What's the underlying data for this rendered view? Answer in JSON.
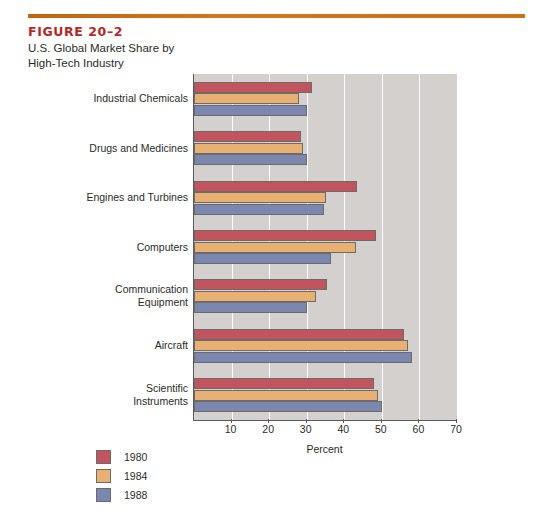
{
  "header": {
    "figure_number": "FIGURE 20–2",
    "caption_line_1": "U.S. Global Market Share by",
    "caption_line_2": "High-Tech Industry",
    "rule_color": "#cf6f16",
    "figure_number_color": "#b02a2a"
  },
  "chart_data": {
    "type": "bar",
    "orientation": "horizontal",
    "title": "U.S. Global Market Share by High-Tech Industry",
    "xlabel": "Percent",
    "ylabel": "",
    "xlim": [
      0,
      70
    ],
    "xticks": [
      10,
      20,
      30,
      40,
      50,
      60,
      70
    ],
    "grid": true,
    "grid_axis": "x",
    "legend_position": "below-left",
    "plot_background": "#d3d0cd",
    "categories": [
      "Industrial Chemicals",
      "Drugs and Medicines",
      "Engines and Turbines",
      "Computers",
      "Communication Equipment",
      "Aircraft",
      "Scientific Instruments"
    ],
    "series": [
      {
        "name": "1980",
        "color": "#c1545c",
        "values": [
          31.5,
          28.5,
          43.5,
          48.5,
          35.5,
          56.0,
          48.0
        ]
      },
      {
        "name": "1984",
        "color": "#e8b173",
        "values": [
          28.0,
          29.0,
          35.0,
          43.0,
          32.5,
          57.0,
          49.0
        ]
      },
      {
        "name": "1988",
        "color": "#7b87ae",
        "values": [
          30.0,
          30.0,
          34.5,
          36.5,
          30.0,
          58.0,
          50.0
        ]
      }
    ]
  },
  "legend": {
    "items": [
      {
        "label": "1980",
        "color": "#c1545c"
      },
      {
        "label": "1984",
        "color": "#e8b173"
      },
      {
        "label": "1988",
        "color": "#7b87ae"
      }
    ]
  }
}
